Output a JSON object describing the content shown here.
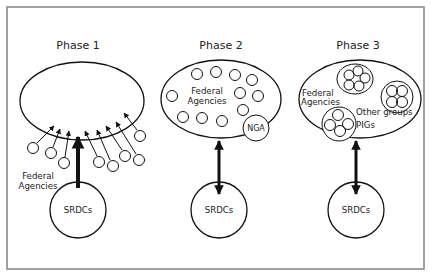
{
  "diagram": {
    "colors": {
      "frame": "#8a8a8a",
      "stroke": "#111111",
      "text": "#222222",
      "background": "#ffffff"
    },
    "phases": [
      {
        "title": "Phase 1",
        "center_label": "SRDCs",
        "outside_label_line1": "Federal",
        "outside_label_line2": "Agencies",
        "arrow": "single thick arrow from SRDCs into ellipse; thin arrows from agency circles into ellipse"
      },
      {
        "title": "Phase 2",
        "center_label": "SRDCs",
        "inside_label_line1": "Federal",
        "inside_label_line2": "Agencies",
        "node_label": "NGA",
        "arrow": "double-headed arrow between ellipse and SRDCs"
      },
      {
        "title": "Phase 3",
        "center_label": "SRDCs",
        "inside_label_line1": "Federal",
        "inside_label_line2": "Agencies",
        "groups_label": "Other groups",
        "pigs_label": "PIGs",
        "arrow": "double-headed arrow between ellipse and SRDCs"
      }
    ]
  }
}
